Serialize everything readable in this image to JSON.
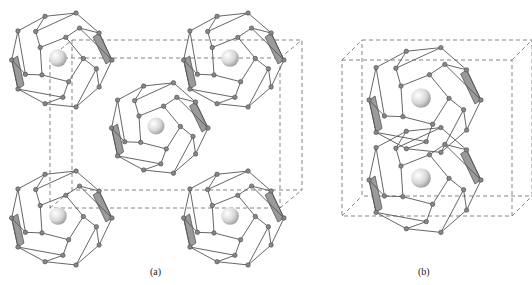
{
  "figure": {
    "panels": [
      {
        "id": "a",
        "caption": "(a)",
        "description": "Cubic unit cell with dodecahedral cages at corners and body center, each enclosing a guest sphere",
        "cages": [
          {
            "cx": 60,
            "cy": 60,
            "r": 52
          },
          {
            "cx": 232,
            "cy": 60,
            "r": 52
          },
          {
            "cx": 158,
            "cy": 128,
            "r": 50
          },
          {
            "cx": 60,
            "cy": 218,
            "r": 52
          },
          {
            "cx": 232,
            "cy": 218,
            "r": 52
          }
        ],
        "cell": {
          "x": 72,
          "y": 40,
          "w": 230,
          "h": 150,
          "dx": -22,
          "dy": 18
        }
      },
      {
        "id": "b",
        "caption": "(b)",
        "description": "Two stacked cages sharing a face inside a dashed box unit cell, each enclosing a guest sphere",
        "cages": [
          {
            "cx": 423,
            "cy": 100,
            "r": 58
          },
          {
            "cx": 423,
            "cy": 180,
            "r": 58
          }
        ],
        "cell": {
          "x": 362,
          "y": 40,
          "w": 170,
          "h": 156,
          "dx": -20,
          "dy": 20
        }
      }
    ],
    "colors": {
      "edge": "#555555",
      "node": "#888888",
      "face": "#9a9a9a",
      "sphere_light": "#ffffff",
      "sphere_dark": "#9c9c9c"
    }
  }
}
